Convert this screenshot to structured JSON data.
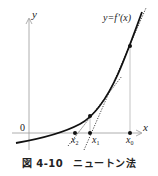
{
  "figure": {
    "caption_number": "図 4-10",
    "caption_title": "ニュートン法"
  },
  "axes": {
    "x_label": "x",
    "y_label": "y",
    "origin_label": "0"
  },
  "curve": {
    "label": "y=f(x)"
  },
  "points": {
    "x0": "x0",
    "x1": "x1",
    "x2": "x2"
  },
  "point_labels": {
    "x0_base": "x",
    "x0_sub": "0",
    "x1_base": "x",
    "x1_sub": "1",
    "x2_base": "x",
    "x2_sub": "2"
  },
  "colors": {
    "axis": "#9a9a9a",
    "curve": "#111111",
    "tangent": "#333333"
  }
}
